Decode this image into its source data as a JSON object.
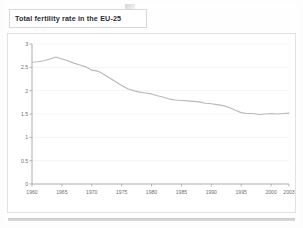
{
  "slide": {
    "title": "Total fertility rate in the EU-25",
    "fold_icon": "page-fold-corner"
  },
  "colors": {
    "title_text": "#2b2b33",
    "card_border": "#e2e2e2",
    "axis": "#9a9aa2",
    "gridline": "#f3eef0",
    "series_line": "#b9b9bd",
    "tick_text": "#6e6e76",
    "bottom_bar": "#c9c9c9"
  },
  "chart_data": {
    "type": "line",
    "title": "Total fertility rate in the EU-25",
    "xlabel": "",
    "ylabel": "",
    "xlim": [
      1960,
      2003
    ],
    "ylim": [
      0,
      3
    ],
    "grid": true,
    "legend": "none",
    "ytick_labels": [
      "0",
      "0.5",
      "1",
      "1.5",
      "2",
      "2.5",
      "3"
    ],
    "ytick_values": [
      0,
      0.5,
      1,
      1.5,
      2,
      2.5,
      3
    ],
    "xtick_labels": [
      "1960",
      "1965",
      "1970",
      "1975",
      "1980",
      "1985",
      "1990",
      "1995",
      "2000",
      "2003"
    ],
    "xtick_values": [
      1960,
      1965,
      1970,
      1975,
      1980,
      1985,
      1990,
      1995,
      2000,
      2003
    ],
    "series": [
      {
        "name": "Total fertility rate (EU-25)",
        "x": [
          1960,
          1961,
          1962,
          1963,
          1964,
          1965,
          1966,
          1967,
          1968,
          1969,
          1970,
          1971,
          1972,
          1973,
          1974,
          1975,
          1976,
          1977,
          1978,
          1979,
          1980,
          1981,
          1982,
          1983,
          1984,
          1985,
          1986,
          1987,
          1988,
          1989,
          1990,
          1991,
          1992,
          1993,
          1994,
          1995,
          1996,
          1997,
          1998,
          1999,
          2000,
          2001,
          2002,
          2003
        ],
        "values": [
          2.61,
          2.62,
          2.64,
          2.68,
          2.72,
          2.68,
          2.64,
          2.59,
          2.55,
          2.51,
          2.44,
          2.42,
          2.35,
          2.27,
          2.19,
          2.11,
          2.04,
          2.0,
          1.97,
          1.95,
          1.93,
          1.89,
          1.86,
          1.82,
          1.8,
          1.79,
          1.78,
          1.77,
          1.76,
          1.73,
          1.72,
          1.7,
          1.68,
          1.64,
          1.58,
          1.53,
          1.51,
          1.51,
          1.49,
          1.5,
          1.51,
          1.5,
          1.51,
          1.52
        ]
      }
    ]
  }
}
